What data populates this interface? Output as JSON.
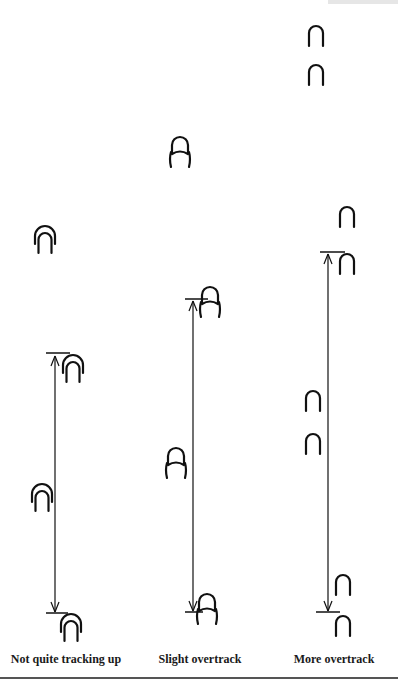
{
  "figure": {
    "header_fragment": "",
    "columns": [
      {
        "id": "not-quite",
        "caption": "Not quite tracking up",
        "x": 55
      },
      {
        "id": "slight",
        "caption": "Slight overtrack",
        "x": 195
      },
      {
        "id": "more",
        "caption": "More overtrack",
        "x": 335
      }
    ],
    "prints": [
      {
        "col": "not-quite",
        "type": "overlap-wide",
        "x": 45,
        "y": 242
      },
      {
        "col": "not-quite",
        "type": "overlap-wide",
        "x": 73,
        "y": 371
      },
      {
        "col": "not-quite",
        "type": "overlap-wide",
        "x": 42,
        "y": 500
      },
      {
        "col": "not-quite",
        "type": "overlap-wide",
        "x": 71,
        "y": 630
      },
      {
        "col": "slight",
        "type": "overlap-narrow",
        "x": 180,
        "y": 155
      },
      {
        "col": "slight",
        "type": "overlap-narrow",
        "x": 210,
        "y": 305
      },
      {
        "col": "slight",
        "type": "overlap-narrow",
        "x": 176,
        "y": 466
      },
      {
        "col": "slight",
        "type": "overlap-narrow",
        "x": 207,
        "y": 612
      },
      {
        "col": "more",
        "type": "single",
        "x": 316,
        "y": 36
      },
      {
        "col": "more",
        "type": "single",
        "x": 316,
        "y": 75
      },
      {
        "col": "more",
        "type": "single",
        "x": 347,
        "y": 217
      },
      {
        "col": "more",
        "type": "single",
        "x": 347,
        "y": 264
      },
      {
        "col": "more",
        "type": "single",
        "x": 313,
        "y": 401
      },
      {
        "col": "more",
        "type": "single",
        "x": 313,
        "y": 444
      },
      {
        "col": "more",
        "type": "single",
        "x": 343,
        "y": 585
      },
      {
        "col": "more",
        "type": "single",
        "x": 343,
        "y": 626
      }
    ],
    "arrows": [
      {
        "col": "not-quite",
        "x": 55,
        "y_top": 355,
        "y_bottom": 613,
        "tick_top": {
          "x1": 46,
          "x2": 70,
          "y": 353
        },
        "tick_bottom": {
          "x1": 46,
          "x2": 68,
          "y": 613
        }
      },
      {
        "col": "slight",
        "x": 193,
        "y_top": 300,
        "y_bottom": 612,
        "tick_top": {
          "x1": 185,
          "x2": 208,
          "y": 299
        },
        "tick_bottom": {
          "x1": 185,
          "x2": 203,
          "y": 612
        }
      },
      {
        "col": "more",
        "x": 328,
        "y_top": 253,
        "y_bottom": 612,
        "tick_top": {
          "x1": 320,
          "x2": 345,
          "y": 252
        },
        "tick_bottom": {
          "x1": 316,
          "x2": 340,
          "y": 612
        }
      }
    ],
    "colors": {
      "ink": "#111111",
      "rule": "#555555"
    }
  }
}
